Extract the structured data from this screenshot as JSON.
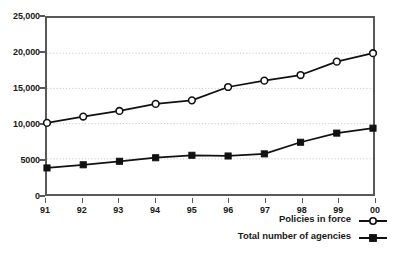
{
  "chart_data": {
    "type": "line",
    "title": "",
    "subtitle": "",
    "xlabel": "",
    "ylabel": "",
    "categories": [
      "91",
      "92",
      "93",
      "94",
      "95",
      "96",
      "97",
      "98",
      "99",
      "00"
    ],
    "ylim": [
      0,
      25000
    ],
    "yticks": [
      0,
      5000,
      10000,
      15000,
      20000,
      25000
    ],
    "ytick_labels": [
      "0",
      "5000",
      "10,000",
      "15,000",
      "20,000",
      "25,000"
    ],
    "grid": true,
    "grid_axis": "y",
    "legend_position": "bottom-right",
    "series": [
      {
        "name": "Policies in force",
        "marker": "open-circle",
        "color": "#111111",
        "values": [
          10100,
          11000,
          11800,
          12800,
          13300,
          15200,
          16100,
          16900,
          18800,
          20000
        ]
      },
      {
        "name": "Total number of agencies",
        "marker": "filled-square",
        "color": "#111111",
        "values": [
          3700,
          4150,
          4650,
          5150,
          5500,
          5400,
          5700,
          7350,
          8650,
          9350
        ]
      }
    ]
  },
  "legend": {
    "items": [
      {
        "label": "Policies in force",
        "marker": "open-circle-marker-icon"
      },
      {
        "label": "Total number of agencies",
        "marker": "filled-square-marker-icon"
      }
    ]
  },
  "colors": {
    "background": "#ffffff",
    "axis": "#585858",
    "grid": "#c9c9c9",
    "ink": "#111111",
    "text": "#1a1a1a"
  }
}
